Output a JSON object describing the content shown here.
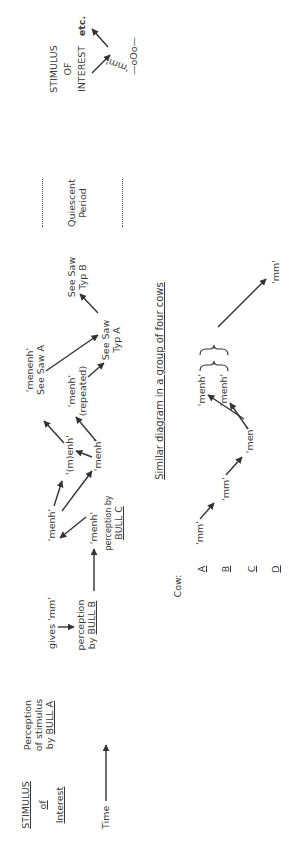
{
  "orientation": "rotated-90-ccw",
  "left_column": {
    "stimulus_heading": [
      "STIMULUS",
      "of",
      "Interest"
    ],
    "perception_heading": [
      "Perception",
      "of stimulus",
      "by"
    ],
    "bull_a": "BULL A",
    "time_label": "Time"
  },
  "bull_diagram": {
    "gives_mm": "gives  'mm'",
    "perception_bull_b": [
      "perception",
      "by"
    ],
    "bull_b": "BULL B",
    "menh_upper": "'menh'",
    "menh_lower": "'menh'",
    "perception_bull_c": "perception by",
    "bull_c": "BULL C",
    "m_enh": "'(m)enh'",
    "menh_middle": "'menh'",
    "menenh": "'menenh'",
    "see_saw_a": "See Saw  A",
    "menh_repeated": [
      "'menh'",
      "(repeated)"
    ],
    "see_saw_typ_a": [
      "See Saw",
      "Typ  A"
    ],
    "see_saw_typ_b": [
      "See Saw",
      "Typ  B"
    ],
    "quiescent_period": [
      "Quiescent",
      "Period"
    ],
    "stimulus_of_interest": [
      "STIMULUS",
      "OF",
      "INTEREST"
    ],
    "mm_end": "'mm'",
    "etc": "etc.",
    "separator": "—oOo—"
  },
  "cow_diagram": {
    "title": "Similar diagram in a group of four cows",
    "cow_label": "Cow:",
    "cows": [
      "A",
      "B",
      "C",
      "D"
    ],
    "mm_a": "'mm'",
    "mm_b": "'mm'",
    "men_c": "'men'",
    "menh_1": "'menh'",
    "menh_2": "'menh'",
    "mm_end": "'mm'"
  },
  "colors": {
    "ink": "#3a3a3a",
    "background": "#ffffff"
  }
}
